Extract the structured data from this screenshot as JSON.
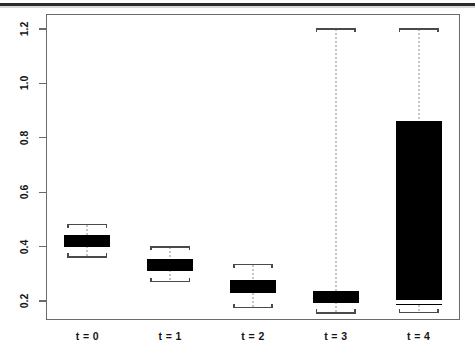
{
  "chart_data": {
    "type": "boxplot",
    "title": "",
    "xlabel": "",
    "ylabel": "",
    "ylim": [
      0.13,
      1.255
    ],
    "yticks": [
      0.2,
      0.4,
      0.6,
      0.8,
      1.0,
      1.2
    ],
    "ytick_labels": [
      "0.2",
      "0.4",
      "0.6",
      "0.8",
      "1.0",
      "1.2"
    ],
    "categories": [
      "t = 0",
      "t = 1",
      "t = 2",
      "t = 3",
      "t = 4"
    ],
    "grid": false,
    "legend": null,
    "box_style": "thick-black-outline",
    "boxes": [
      {
        "category": "t = 0",
        "whisker_low": 0.362,
        "q1": 0.401,
        "median": 0.422,
        "q3": 0.443,
        "whisker_high": 0.481,
        "filled": false
      },
      {
        "category": "t = 1",
        "whisker_low": 0.272,
        "q1": 0.312,
        "median": 0.334,
        "q3": 0.356,
        "whisker_high": 0.399,
        "filled": false
      },
      {
        "category": "t = 2",
        "whisker_low": 0.176,
        "q1": 0.228,
        "median": 0.254,
        "q3": 0.277,
        "whisker_high": 0.334,
        "filled": false
      },
      {
        "category": "t = 3",
        "whisker_low": 0.156,
        "q1": 0.196,
        "median": 0.215,
        "q3": 0.236,
        "whisker_high": 1.2,
        "filled": false
      },
      {
        "category": "t = 4",
        "whisker_low": 0.158,
        "q1": 0.186,
        "median": 0.197,
        "q3": 0.861,
        "whisker_high": 1.2,
        "filled": true
      }
    ],
    "colors": {
      "box_outline": "#000000",
      "box_fill_open": "#ffffff",
      "box_fill_solid": "#000000",
      "median": "#000000",
      "median_on_solid": "#ffffff",
      "whisker": "#8a8a8a",
      "whisker_cap": "#4a4a4a",
      "frame": "#6b6b6b",
      "background": "#ffffff",
      "text": "#141414"
    }
  }
}
